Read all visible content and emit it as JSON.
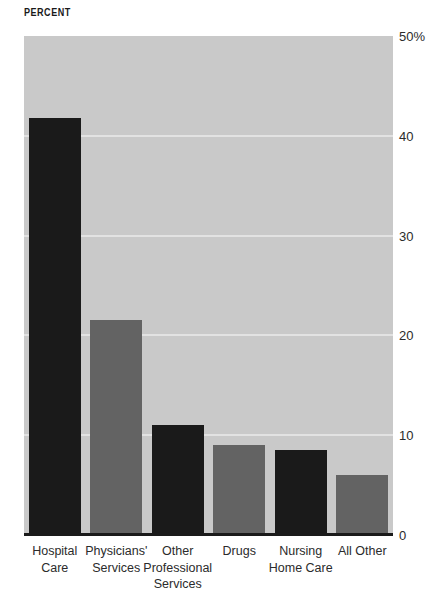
{
  "chart_data": {
    "type": "bar",
    "title": "PERCENT",
    "xlabel": "",
    "ylabel": "PERCENT",
    "ylim": [
      0,
      50
    ],
    "grid": true,
    "legend": "none",
    "y_ticks": [
      {
        "value": 50,
        "label": "50%"
      },
      {
        "value": 40,
        "label": "40"
      },
      {
        "value": 30,
        "label": "30"
      },
      {
        "value": 20,
        "label": "20"
      },
      {
        "value": 10,
        "label": "10"
      },
      {
        "value": 0,
        "label": "0"
      }
    ],
    "categories": [
      "Hospital\nCare",
      "Physicians'\nServices",
      "Other\nProfessional\nServices",
      "Drugs",
      "Nursing\nHome Care",
      "All Other"
    ],
    "values": [
      41.8,
      21.5,
      11.0,
      9.0,
      8.5,
      6.0
    ],
    "bar_colors": [
      "#1a1a1a",
      "#636363",
      "#1a1a1a",
      "#636363",
      "#1a1a1a",
      "#636363"
    ],
    "plot_background": "#c9c9c9",
    "gridline_color": "#e2e2e2",
    "baseline_color": "#1a1a1a",
    "page_background": "#ffffff"
  }
}
